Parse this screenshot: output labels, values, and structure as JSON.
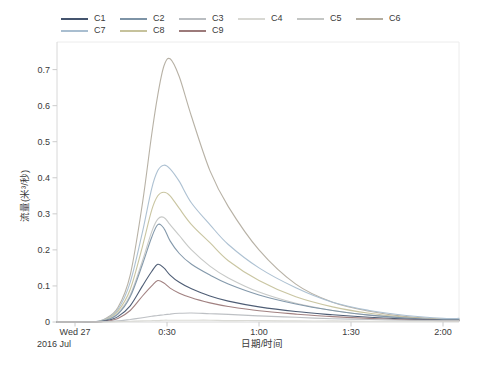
{
  "figure": {
    "background": "#ffffff"
  },
  "legend": {
    "items": [
      {
        "label": "C1",
        "color": "#44546e"
      },
      {
        "label": "C2",
        "color": "#7d93a6"
      },
      {
        "label": "C3",
        "color": "#b9bdc1"
      },
      {
        "label": "C4",
        "color": "#d8d8d3"
      },
      {
        "label": "C5",
        "color": "#c4c6c4"
      },
      {
        "label": "C6",
        "color": "#b3ada0"
      },
      {
        "label": "C7",
        "color": "#a9bed0"
      },
      {
        "label": "C8",
        "color": "#c6c29c"
      },
      {
        "label": "C9",
        "color": "#9c7a7a"
      }
    ]
  },
  "y_axis": {
    "label": "流量(米³/秒)",
    "tick_labels": [
      "0",
      "0.1",
      "0.2",
      "0.3",
      "0.4",
      "0.5",
      "0.6",
      "0.7"
    ]
  },
  "x_axis": {
    "label": "日期/时间",
    "tick_labels": [
      "Wed 27",
      "0:30",
      "1:00",
      "1:30",
      "2:00"
    ],
    "first_tick_line2": "2016 Jul",
    "tick_minutes": [
      0,
      30,
      60,
      90,
      120
    ]
  },
  "chart_data": {
    "type": "line",
    "title": "",
    "xlabel": "日期/时间",
    "ylabel": "流量(米³/秒)",
    "x_unit": "minutes after Wed 27 2016 Jul 0:00",
    "ylim": [
      0,
      0.75
    ],
    "grid": false,
    "legend_position": "top",
    "x": [
      0,
      6,
      10,
      14,
      18,
      22,
      25,
      27,
      29,
      31,
      34,
      38,
      44,
      50,
      60,
      72,
      84,
      96,
      108,
      120
    ],
    "series": [
      {
        "name": "C1",
        "color": "#44546e",
        "values": [
          0,
          0,
          0.003,
          0.015,
          0.045,
          0.1,
          0.14,
          0.16,
          0.15,
          0.13,
          0.11,
          0.092,
          0.072,
          0.058,
          0.042,
          0.029,
          0.02,
          0.013,
          0.008,
          0.005
        ]
      },
      {
        "name": "C2",
        "color": "#7d93a6",
        "values": [
          0,
          0,
          0.005,
          0.022,
          0.07,
          0.16,
          0.235,
          0.27,
          0.26,
          0.225,
          0.19,
          0.16,
          0.13,
          0.105,
          0.075,
          0.05,
          0.032,
          0.019,
          0.011,
          0.006
        ]
      },
      {
        "name": "C3",
        "color": "#b9bdc1",
        "values": [
          0,
          0,
          0.001,
          0.003,
          0.007,
          0.012,
          0.016,
          0.018,
          0.02,
          0.022,
          0.024,
          0.025,
          0.023,
          0.021,
          0.017,
          0.013,
          0.009,
          0.007,
          0.005,
          0.004
        ]
      },
      {
        "name": "C4",
        "color": "#d8d8d3",
        "values": [
          0,
          0,
          0,
          0.001,
          0.002,
          0.003,
          0.004,
          0.004,
          0.005,
          0.005,
          0.005,
          0.005,
          0.005,
          0.004,
          0.004,
          0.003,
          0.003,
          0.002,
          0.002,
          0.002
        ]
      },
      {
        "name": "C5",
        "color": "#c4c6c4",
        "values": [
          0,
          0,
          0.005,
          0.025,
          0.075,
          0.17,
          0.25,
          0.285,
          0.29,
          0.27,
          0.24,
          0.2,
          0.155,
          0.122,
          0.083,
          0.052,
          0.032,
          0.019,
          0.011,
          0.006
        ]
      },
      {
        "name": "C6",
        "color": "#b3ada0",
        "values": [
          0,
          0,
          0.01,
          0.04,
          0.13,
          0.33,
          0.52,
          0.63,
          0.71,
          0.73,
          0.68,
          0.57,
          0.42,
          0.32,
          0.2,
          0.105,
          0.055,
          0.03,
          0.015,
          0.008
        ]
      },
      {
        "name": "C7",
        "color": "#a9bed0",
        "values": [
          0,
          0,
          0.008,
          0.035,
          0.11,
          0.25,
          0.37,
          0.42,
          0.435,
          0.425,
          0.39,
          0.33,
          0.27,
          0.215,
          0.15,
          0.095,
          0.055,
          0.032,
          0.018,
          0.01
        ]
      },
      {
        "name": "C8",
        "color": "#c6c29c",
        "values": [
          0,
          0,
          0.006,
          0.03,
          0.09,
          0.21,
          0.31,
          0.35,
          0.36,
          0.35,
          0.315,
          0.27,
          0.22,
          0.17,
          0.115,
          0.07,
          0.042,
          0.024,
          0.013,
          0.007
        ]
      },
      {
        "name": "C9",
        "color": "#9c7a7a",
        "values": [
          0,
          0,
          0.002,
          0.01,
          0.032,
          0.072,
          0.1,
          0.115,
          0.108,
          0.094,
          0.08,
          0.067,
          0.053,
          0.043,
          0.031,
          0.022,
          0.015,
          0.01,
          0.006,
          0.004
        ]
      }
    ]
  }
}
